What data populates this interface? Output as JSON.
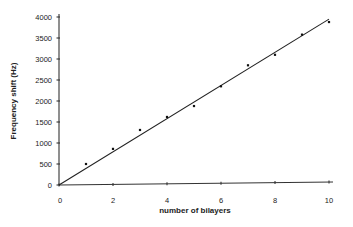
{
  "chart_data": {
    "type": "scatter",
    "title": "",
    "xlabel": "number of bilayers",
    "ylabel": "Frequency shift (Hz)",
    "xlim": [
      0,
      10
    ],
    "ylim": [
      0,
      4000
    ],
    "x_ticks": [
      0,
      2,
      4,
      6,
      8,
      10
    ],
    "y_ticks": [
      0,
      500,
      1000,
      1500,
      2000,
      2500,
      3000,
      3500,
      4000
    ],
    "grid": false,
    "legend": null,
    "series": [
      {
        "name": "measured",
        "type": "scatter",
        "x": [
          1,
          2,
          3,
          4,
          5,
          6,
          7,
          8,
          9,
          10
        ],
        "y": [
          500,
          860,
          1310,
          1620,
          1880,
          2350,
          2850,
          3100,
          3580,
          3880
        ]
      },
      {
        "name": "linear fit",
        "type": "line",
        "x": [
          0,
          10
        ],
        "y": [
          0,
          3950
        ]
      }
    ]
  }
}
